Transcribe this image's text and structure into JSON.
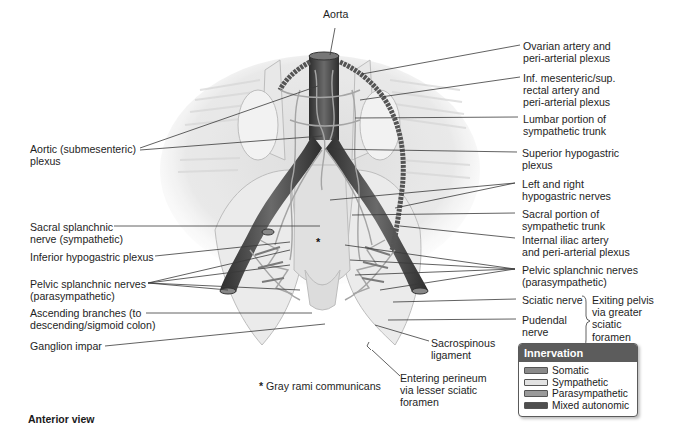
{
  "figure": {
    "view_label": "Anterior view",
    "footnote": {
      "marker": "*",
      "text": "Gray rami communicans"
    }
  },
  "labels": {
    "aorta": "Aorta",
    "aortic_plexus": [
      "Aortic (submesenteric)",
      "plexus"
    ],
    "sacral_splanchnic": [
      "Sacral splanchnic",
      "nerve (sympathetic)"
    ],
    "inferior_hypogastric": [
      "Inferior hypogastric plexus"
    ],
    "pelvic_splanchnic_left": [
      "Pelvic splanchnic nerves",
      "(parasympathetic)"
    ],
    "ascending_branches": [
      "Ascending branches (to",
      "descending/sigmoid colon)"
    ],
    "ganglion_impar": [
      "Ganglion impar"
    ],
    "ovarian_artery": [
      "Ovarian artery and",
      "peri-arterial plexus"
    ],
    "inf_mesenteric": [
      "Inf. mesenteric/sup.",
      "rectal artery and",
      "peri-arterial plexus"
    ],
    "lumbar_portion": [
      "Lumbar portion of",
      "sympathetic trunk"
    ],
    "superior_hypogastric": [
      "Superior hypogastric",
      "plexus"
    ],
    "hypogastric_nerves": [
      "Left and right",
      "hypogastric nerves"
    ],
    "sacral_portion": [
      "Sacral portion of",
      "sympathetic trunk"
    ],
    "internal_iliac": [
      "Internal iliac artery",
      "and peri-arterial plexus"
    ],
    "pelvic_splanchnic_right": [
      "Pelvic splanchnic nerves",
      "(parasympathetic)"
    ],
    "sciatic_nerve": [
      "Sciatic nerve"
    ],
    "pudendal_nerve": [
      "Pudendal",
      "nerve"
    ],
    "exiting_pelvis": [
      "Exiting pelvis",
      "via greater",
      "sciatic",
      "foramen"
    ],
    "sacrospinous": [
      "Sacrospinous",
      "ligament"
    ],
    "entering_perineum": [
      "Entering perineum",
      "via lesser sciatic",
      "foramen"
    ]
  },
  "legend": {
    "title": "Innervation",
    "items": [
      {
        "label": "Somatic",
        "color": "#8a8a8a"
      },
      {
        "label": "Sympathetic",
        "color": "#e2e2e2"
      },
      {
        "label": "Parasympathetic",
        "color": "#9a9a9a"
      },
      {
        "label": "Mixed autonomic",
        "color": "#4e4e4e"
      }
    ]
  },
  "colors": {
    "vessel": "#4a4a4a",
    "nerve": "#a8a8a8",
    "bone": "#e4e4e4",
    "leader": "#3a3a3a",
    "legend_header": "#5c5c5c"
  }
}
